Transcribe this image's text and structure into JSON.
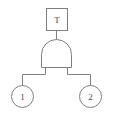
{
  "diagram": {
    "type": "fault-tree",
    "title": "",
    "background_color": "#ffffff",
    "line_color": "#7f7f7f",
    "text_color": "#4a4a4a"
  },
  "top_event": {
    "shape": "rectangle",
    "label": "T"
  },
  "gate": {
    "shape": "and-gate",
    "label": "",
    "kind": "AND"
  },
  "basic_events": [
    {
      "shape": "circle",
      "label": "1"
    },
    {
      "shape": "circle",
      "label": "2"
    }
  ],
  "connectors": {
    "top_to_gate": "vertical-line",
    "gate_to_inputs": "orthogonal-branch"
  }
}
